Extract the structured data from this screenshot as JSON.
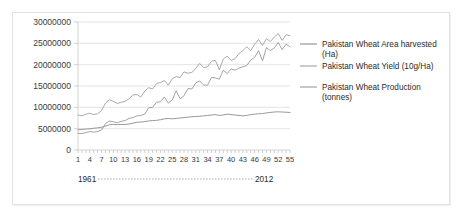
{
  "chart_data": {
    "type": "line",
    "title": "",
    "xlabel": "",
    "ylabel": "",
    "ylim": [
      0,
      30000000
    ],
    "ytick_labels": [
      "0",
      "5000000",
      "10000000",
      "15000000",
      "20000000",
      "25000000",
      "30000000"
    ],
    "ytick_values": [
      0,
      5000000,
      10000000,
      15000000,
      20000000,
      25000000,
      30000000
    ],
    "xtick_labels": [
      "1",
      "4",
      "7",
      "10",
      "13",
      "16",
      "19",
      "22",
      "25",
      "28",
      "31",
      "34",
      "37",
      "40",
      "43",
      "46",
      "49",
      "52",
      "55"
    ],
    "xtick_values": [
      1,
      4,
      7,
      10,
      13,
      16,
      19,
      22,
      25,
      28,
      31,
      34,
      37,
      40,
      43,
      46,
      49,
      52,
      55
    ],
    "xlim": [
      1,
      55
    ],
    "grid": true,
    "legend_position": "right",
    "range_start_label": "1961",
    "range_end_label": "2012",
    "series": [
      {
        "name": "Pakistan Wheat Area harvested (Ha)",
        "color": "#8c8c8c",
        "values": [
          4730000,
          4850000,
          4900000,
          4980000,
          5100000,
          5200000,
          5320000,
          5600000,
          5900000,
          6000000,
          5950000,
          5980000,
          5990000,
          6100000,
          6300000,
          6500000,
          6550000,
          6650000,
          6800000,
          6900000,
          6950000,
          7100000,
          7300000,
          7400000,
          7300000,
          7400000,
          7500000,
          7600000,
          7700000,
          7800000,
          7850000,
          7900000,
          8000000,
          8100000,
          8200000,
          8300000,
          8100000,
          8200000,
          8400000,
          8300000,
          8200000,
          8100000,
          8000000,
          8100000,
          8300000,
          8400000,
          8500000,
          8550000,
          8700000,
          8800000,
          8900000,
          8950000,
          8900000,
          8850000,
          8800000
        ]
      },
      {
        "name": "Pakistan Wheat Yield (10g/Ha)",
        "color": "#a0a0a0",
        "values": [
          8200000,
          8000000,
          8400000,
          8600000,
          8300000,
          8500000,
          9200000,
          11000000,
          11800000,
          11400000,
          10900000,
          11200000,
          11400000,
          12000000,
          12900000,
          13000000,
          12400000,
          13800000,
          14600000,
          14300000,
          15600000,
          15800000,
          16300000,
          15200000,
          16700000,
          17200000,
          17000000,
          18300000,
          18000000,
          18200000,
          19100000,
          20300000,
          19300000,
          19500000,
          20800000,
          21000000,
          18800000,
          21300000,
          22000000,
          21000000,
          21400000,
          22600000,
          23300000,
          24200000,
          23300000,
          24800000,
          25900000,
          24500000,
          26100000,
          25400000,
          26500000,
          27300000,
          25700000,
          27000000,
          26800000
        ]
      },
      {
        "name": "Pakistan Wheat Production (tonnes)",
        "color": "#9a9a9a",
        "values": [
          3900000,
          3850000,
          4100000,
          4300000,
          4200000,
          4300000,
          4700000,
          6200000,
          6800000,
          6600000,
          6400000,
          6700000,
          6900000,
          7400000,
          7600000,
          8000000,
          8100000,
          8400000,
          9900000,
          10000000,
          11200000,
          11300000,
          12400000,
          11000000,
          11700000,
          13900000,
          12000000,
          12700000,
          14400000,
          14300000,
          15700000,
          16200000,
          15200000,
          15200000,
          17000000,
          16900000,
          16600000,
          18700000,
          17900000,
          19000000,
          18700000,
          19200000,
          19500000,
          19800000,
          21100000,
          21700000,
          23300000,
          20900000,
          24000000,
          23300000,
          23900000,
          25200000,
          23500000,
          24800000,
          24200000
        ]
      }
    ]
  },
  "legend": {
    "items": [
      {
        "label": "Pakistan Wheat Area harvested (Ha)"
      },
      {
        "label": "Pakistan Wheat Yield (10g/Ha)"
      },
      {
        "label": "Pakistan Wheat Production (tonnes)"
      }
    ]
  },
  "axis_range": {
    "start": "1961",
    "end": "2012"
  },
  "colors": {
    "grid": "#d9d9d9",
    "axis": "#c9c9c9",
    "text": "#3a3a3a",
    "frame": "#e3e3e3"
  }
}
